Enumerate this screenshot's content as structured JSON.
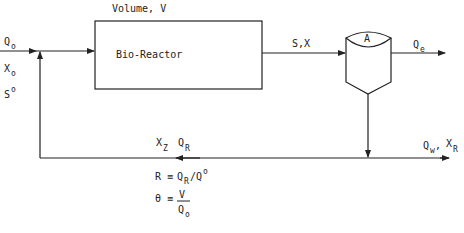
{
  "diagram": {
    "reactor": {
      "label": "Bio-Reactor",
      "volume_label": "Volume, V"
    },
    "clarifier": {
      "label": "A"
    },
    "inlet": {
      "flow": "Q",
      "flow_sub": "o",
      "biomass": "X",
      "biomass_sub": "o",
      "substrate": "S",
      "substrate_sup": "o"
    },
    "reactor_outlet": {
      "label": "S,X"
    },
    "effluent": {
      "flow": "Q",
      "flow_sub": "e"
    },
    "recycle": {
      "biomass": "X",
      "biomass_sub": "Z",
      "flow": "Q",
      "flow_sub": "R"
    },
    "waste": {
      "flow": "Q",
      "flow_sub": "w",
      "sep": ",",
      "biomass": "X",
      "biomass_sub": "R"
    },
    "equations": {
      "recycle_ratio": {
        "lhs": "R",
        "op": "≡",
        "num": "Q",
        "num_sub": "R",
        "slash": "/",
        "den": "Q",
        "den_sup": "o"
      },
      "residence_time": {
        "lhs": "θ",
        "op": "≡",
        "num": "V",
        "den": "Q",
        "den_sub": "o"
      }
    },
    "colors": {
      "line": "#222222",
      "background": "#ffffff"
    }
  }
}
